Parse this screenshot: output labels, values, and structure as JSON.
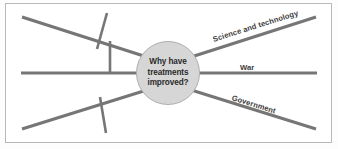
{
  "diagram": {
    "type": "mind-map",
    "center": {
      "text": "Why have\ntreatments\nimproved?",
      "fill_color": "#d6d6d6",
      "border_color": "#aeaeae"
    },
    "line_color": "#767676",
    "frame_border_color": "#b9b9b9",
    "background_color": "#ffffff",
    "labels": {
      "science_and_technology": "Science and technology",
      "war": "War",
      "government": "Government"
    },
    "branches": [
      {
        "name": "science-and-technology",
        "label": "Science and technology",
        "direction": "upper-right",
        "labelled": true
      },
      {
        "name": "war",
        "label": "War",
        "direction": "right",
        "labelled": true
      },
      {
        "name": "government",
        "label": "Government",
        "direction": "lower-right",
        "labelled": true
      },
      {
        "name": "upper-left",
        "label": "",
        "direction": "upper-left",
        "labelled": false
      },
      {
        "name": "left",
        "label": "",
        "direction": "left",
        "labelled": false
      },
      {
        "name": "lower-left",
        "label": "",
        "direction": "lower-left",
        "labelled": false
      }
    ],
    "sub_branches": [
      {
        "name": "upper-left-sub-diagonal",
        "parent": "upper-left"
      },
      {
        "name": "upper-left-sub-vertical",
        "parent": "upper-left"
      },
      {
        "name": "lower-left-sub-vertical",
        "parent": "lower-left"
      }
    ]
  }
}
